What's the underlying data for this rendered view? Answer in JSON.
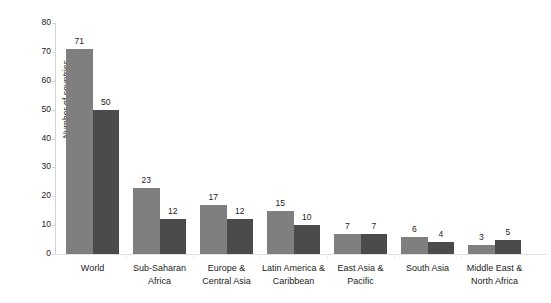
{
  "chart_data": {
    "type": "bar",
    "title": "",
    "xlabel": "",
    "ylabel": "Number of countries",
    "ylim": [
      0,
      80
    ],
    "yticks": [
      0,
      10,
      20,
      30,
      40,
      50,
      60,
      70,
      80
    ],
    "grid": false,
    "legend": "none",
    "categories": [
      "World",
      "Sub-Saharan Africa",
      "Europe & Central Asia",
      "Latin America & Caribbean",
      "East Asia & Pacific",
      "South Asia",
      "Middle East & North Africa"
    ],
    "category_lines": [
      [
        "World"
      ],
      [
        "Sub-Saharan",
        "Africa"
      ],
      [
        "Europe &",
        "Central Asia"
      ],
      [
        "Latin America &",
        "Caribbean"
      ],
      [
        "East Asia &",
        "Pacific"
      ],
      [
        "South Asia"
      ],
      [
        "Middle East &",
        "North Africa"
      ]
    ],
    "series": [
      {
        "name": "series-1",
        "color": "#7f7f7f",
        "values": [
          71,
          23,
          17,
          15,
          7,
          6,
          3
        ]
      },
      {
        "name": "series-2",
        "color": "#4b4b4b",
        "values": [
          50,
          12,
          12,
          10,
          7,
          4,
          5
        ]
      }
    ],
    "data_labels": [
      [
        "71",
        "50"
      ],
      [
        "23",
        "12"
      ],
      [
        "17",
        "12"
      ],
      [
        "15",
        "10"
      ],
      [
        "7",
        "7"
      ],
      [
        "6",
        "4"
      ],
      [
        "3",
        "5"
      ]
    ]
  },
  "axis": {
    "y_title": "Number of countries",
    "y_tick_labels": [
      "0",
      "10",
      "20",
      "30",
      "40",
      "50",
      "60",
      "70",
      "80"
    ]
  }
}
